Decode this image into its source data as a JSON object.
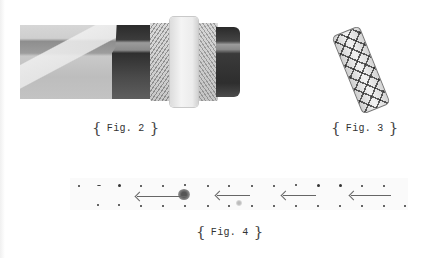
{
  "figures": [
    {
      "id": "fig2",
      "caption_open": "{",
      "caption": "Fig. 2",
      "caption_close": "}",
      "subject": "rolled tube with wrapped printed paper, white band and dark end cap"
    },
    {
      "id": "fig3",
      "caption_open": "{",
      "caption": "Fig. 3",
      "caption_close": "}",
      "subject": "tilted cylindrical wrap with crisscross stitching"
    },
    {
      "id": "fig4",
      "caption_open": "{",
      "caption": "Fig. 4",
      "caption_close": "}",
      "subject": "perforated strip with leftward arrows",
      "arrow_count": 4,
      "arrow_direction": "left"
    }
  ],
  "colors": {
    "background": "#ffffff",
    "ink": "#333333"
  }
}
